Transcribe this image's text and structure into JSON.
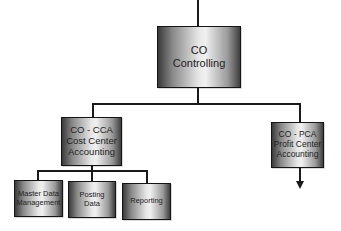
{
  "diagram": {
    "root": {
      "lines": [
        "CO",
        "Controlling"
      ]
    },
    "children": [
      {
        "id": "cca",
        "lines": [
          "CO - CCA",
          "Cost Center",
          "Accounting"
        ]
      },
      {
        "id": "pca",
        "lines": [
          "CO - PCA",
          "Profit Center",
          "Accounting"
        ]
      }
    ],
    "cca_children": [
      {
        "lines": [
          "Master Data",
          "Management"
        ]
      },
      {
        "lines": [
          "Posting",
          "Data"
        ]
      },
      {
        "lines": [
          "Reporting"
        ]
      }
    ],
    "colors": {
      "line": "#1a1a1a",
      "box_border": "#151515",
      "box_dark": "#3a3a3a",
      "box_light": "#f0f0f0"
    }
  }
}
